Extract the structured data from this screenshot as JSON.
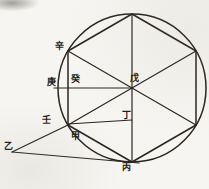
{
  "figure": {
    "kind": "woodblock geometric diagram",
    "ink_color": "#2b2620",
    "paper_color": "#f6f5f1",
    "point_labels": [
      {
        "id": "yi",
        "char": "乙",
        "x": 8,
        "y": 146
      },
      {
        "id": "xin",
        "char": "辛",
        "x": 59,
        "y": 46
      },
      {
        "id": "geng",
        "char": "庚",
        "x": 51,
        "y": 82
      },
      {
        "id": "gui",
        "char": "癸",
        "x": 75,
        "y": 79
      },
      {
        "id": "ren",
        "char": "壬",
        "x": 46,
        "y": 120
      },
      {
        "id": "jia",
        "char": "甲",
        "x": 75,
        "y": 136
      },
      {
        "id": "wu",
        "char": "戊",
        "x": 134,
        "y": 78
      },
      {
        "id": "ding",
        "char": "丁",
        "x": 126,
        "y": 115
      },
      {
        "id": "bing",
        "char": "丙",
        "x": 126,
        "y": 167
      }
    ]
  }
}
